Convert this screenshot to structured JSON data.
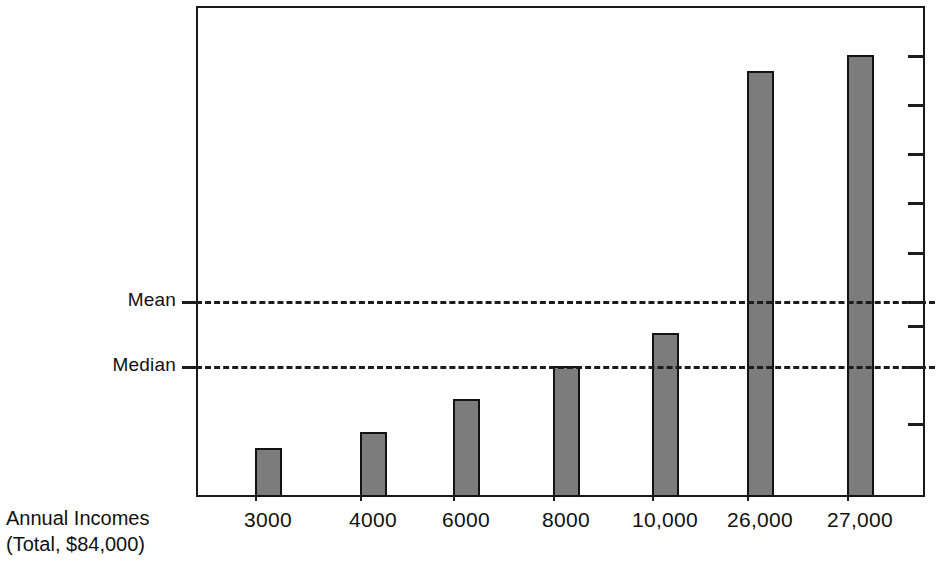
{
  "chart_data": {
    "type": "bar",
    "title": "",
    "subtitle": "",
    "xlabel": "Annual Incomes (Total, $84,000)",
    "ylabel": "",
    "categories": [
      "3000",
      "4000",
      "6000",
      "8000",
      "10,000",
      "26,000",
      "27,000"
    ],
    "values": [
      3000,
      4000,
      6000,
      8000,
      10000,
      26000,
      27000
    ],
    "series": [
      {
        "name": "Annual Income",
        "values": [
          3000,
          4000,
          6000,
          8000,
          10000,
          26000,
          27000
        ]
      }
    ],
    "ylim": [
      0,
      30000
    ],
    "grid": false,
    "legend": "none",
    "bar_color": "#7c7c7c",
    "bar_edge_color": "#131313",
    "annotations": [
      {
        "label": "Mean",
        "value": 12000,
        "style": "dashed-horizontal-line"
      },
      {
        "label": "Median",
        "value": 8000,
        "style": "dashed-horizontal-line"
      }
    ],
    "right_axis_ticks": [
      27000,
      24000,
      21000,
      18000,
      15000,
      12000,
      10500,
      8000,
      4500
    ],
    "right_axis_tick_labels": []
  },
  "axis_caption": {
    "line1": "Annual Incomes",
    "line2": "(Total, $84,000)"
  },
  "reference_lines": {
    "mean": {
      "label": "Mean"
    },
    "median": {
      "label": "Median"
    }
  },
  "colors": {
    "bar_fill": "#7c7c7c",
    "bar_stroke": "#131313",
    "axis": "#1a1a1a",
    "text": "#111111",
    "background": "#ffffff"
  }
}
